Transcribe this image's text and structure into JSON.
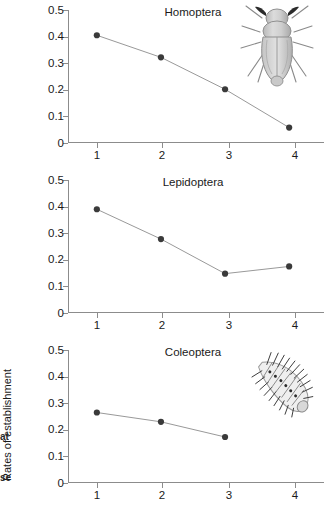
{
  "figure": {
    "ylabel": "Rates of establishment",
    "caption_fragments": [
      "at",
      "se"
    ],
    "marker_color": "#3a3a3a",
    "line_color": "#999999",
    "axis_color": "#8c8c8c",
    "background": "#ffffff"
  },
  "axes": {
    "ytick_labels": [
      "0.5",
      "0.4",
      "0.3",
      "0.2",
      "0.1",
      "0"
    ],
    "ytick_values": [
      0.5,
      0.4,
      0.3,
      0.2,
      0.1,
      0
    ],
    "xtick_labels": [
      "1",
      "2",
      "3",
      "4"
    ],
    "xtick_values": [
      1,
      2,
      3,
      4
    ]
  },
  "panels": {
    "homoptera": {
      "title": "Homoptera",
      "insect_icon": "planthopper-dorsal-icon"
    },
    "lepidoptera": {
      "title": "Lepidoptera",
      "insect_icon": "caterpillar-icon"
    },
    "coleoptera": {
      "title": "Coleoptera",
      "insect_icon": "beetle-lateral-icon"
    }
  },
  "chart_data": [
    {
      "type": "line",
      "title": "Homoptera",
      "xlabel": "",
      "ylabel": "Rates of establishment",
      "x": [
        1,
        2,
        3,
        4
      ],
      "values": [
        0.405,
        0.322,
        0.202,
        0.058
      ],
      "categories": [
        "1",
        "2",
        "3",
        "4"
      ],
      "xlim": [
        0.55,
        4.45
      ],
      "ylim": [
        0,
        0.5
      ],
      "grid": false,
      "legend": "none"
    },
    {
      "type": "line",
      "title": "Lepidoptera",
      "xlabel": "",
      "ylabel": "Rates of establishment",
      "x": [
        1,
        2,
        3,
        4
      ],
      "values": [
        0.39,
        0.278,
        0.148,
        0.175
      ],
      "categories": [
        "1",
        "2",
        "3",
        "4"
      ],
      "xlim": [
        0.55,
        4.45
      ],
      "ylim": [
        0,
        0.5
      ],
      "grid": false,
      "legend": "none"
    },
    {
      "type": "line",
      "title": "Coleoptera",
      "xlabel": "",
      "ylabel": "Rates of establishment",
      "x": [
        1,
        2,
        3
      ],
      "values": [
        0.265,
        0.23,
        0.173
      ],
      "categories": [
        "1",
        "2",
        "3",
        "4"
      ],
      "xlim": [
        0.55,
        4.45
      ],
      "ylim": [
        0,
        0.5
      ],
      "grid": false,
      "legend": "none"
    }
  ]
}
